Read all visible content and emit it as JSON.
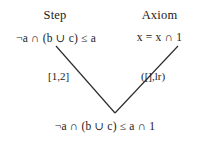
{
  "figure": {
    "name": "inference-step-diagram",
    "background_color": "#ffffff",
    "line_color": "#2b2b2b",
    "text_color": "#1a1a1a"
  },
  "headers": {
    "left": "Step",
    "right": "Axiom"
  },
  "premises": {
    "left": "¬a ∩ (b ∪ c) ≤ a",
    "right": "x = x ∩ 1"
  },
  "edge_labels": {
    "left": "[1,2]",
    "right": "([],lr)"
  },
  "conclusion": "¬a ∩ (b ∪ c) ≤ a ∩ 1",
  "connector": {
    "type": "v-shape",
    "left_line": {
      "x1": 56,
      "y1": 46,
      "x2": 115,
      "y2": 113
    },
    "right_line": {
      "x1": 115,
      "y1": 113,
      "x2": 178,
      "y2": 46
    }
  }
}
